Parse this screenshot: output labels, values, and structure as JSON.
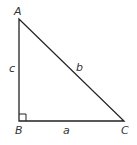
{
  "diagram": {
    "type": "right-triangle",
    "stroke_color": "#222222",
    "vertices": [
      {
        "name": "A",
        "label": "A"
      },
      {
        "name": "B",
        "label": "B"
      },
      {
        "name": "C",
        "label": "C"
      }
    ],
    "sides": [
      {
        "name": "a",
        "label": "a",
        "between": "B-C"
      },
      {
        "name": "b",
        "label": "b",
        "between": "A-C"
      },
      {
        "name": "c",
        "label": "c",
        "between": "A-B"
      }
    ],
    "right_angle_at": "B"
  }
}
